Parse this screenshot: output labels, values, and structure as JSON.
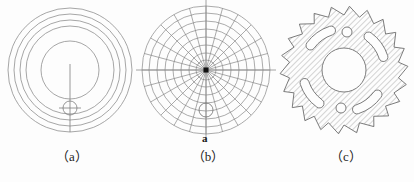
{
  "figure": {
    "background_color": "#fdfdfd",
    "line_color": "#8a8a8a",
    "dark_line_color": "#5a5a5a",
    "ink_color": "#1d1d1d",
    "hatch_color": "#8d8d8d",
    "panels": [
      {
        "id": "a",
        "caption": "（a）",
        "kind": "concentric-circles-diagram",
        "description": "concentric circle contour diagram with vertical centerline and small crosshair circle",
        "center": {
          "cx": 70,
          "cy": 70
        },
        "rings": [
          62,
          56,
          50,
          44,
          29
        ],
        "centerline": {
          "x": 70,
          "y1": 64,
          "y2": 132
        },
        "marker_circle": {
          "cx": 70,
          "cy": 108,
          "r": 7
        },
        "marker_crosshair": {
          "half_width": 11
        }
      },
      {
        "id": "b",
        "caption": "（b）",
        "kind": "polar-grid-diagram",
        "description": "polar grid with radial spokes, concentric rings, dark square hub and small circle marker",
        "center": {
          "cx": 68,
          "cy": 70
        },
        "outer_radius": 64,
        "spoke_count": 24,
        "rings": [
          64,
          57,
          49,
          41,
          33,
          25,
          17,
          10
        ],
        "hub": {
          "size": 5,
          "color": "#111111"
        },
        "axis_extend": 6,
        "marker_circle": {
          "cx": 68,
          "cy": 110,
          "r": 7
        },
        "inner_label": {
          "text": "a",
          "x": 64,
          "y": 132
        }
      },
      {
        "id": "c",
        "caption": "（c）",
        "kind": "hatched-saw-blade-section",
        "description": "cross-hatched circular saw blade with teeth, central bore, four curved kidney slots and two round holes",
        "center": {
          "cx": 66,
          "cy": 70
        },
        "tooth_count": 22,
        "outer_radius": 64,
        "root_radius": 55,
        "bore_radius": 22,
        "kidney_slots": 4,
        "round_holes": 2,
        "hatch_angle_deg": 45,
        "hatch_spacing": 4
      }
    ]
  }
}
